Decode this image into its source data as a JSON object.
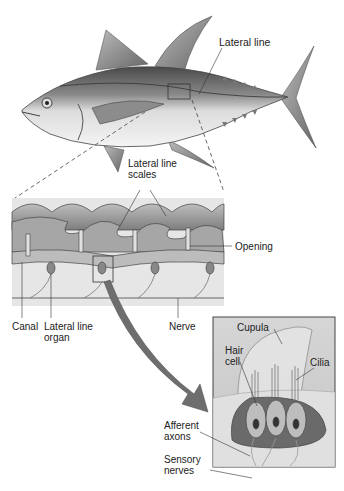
{
  "figure": {
    "panels": [
      "whole-fish",
      "lateral-line-scales-section",
      "neuromast-detail"
    ]
  },
  "labels": {
    "lateral_line_top": "Lateral line",
    "lateral_line_scales": "Lateral line\nscales",
    "opening": "Opening",
    "canal": "Canal",
    "lateral_line_organ": "Lateral line\norgan",
    "nerve": "Nerve",
    "cupula": "Cupula",
    "hair_cell": "Hair\ncell",
    "cilia": "Cilia",
    "afferent_axons": "Afferent\naxons",
    "sensory_nerves": "Sensory\nnerves"
  },
  "colors": {
    "line": "#333333",
    "fish_dark": "#5a5a5a",
    "fish_light": "#e6e6e6",
    "scale": "#9a9a9a",
    "tissue": "#d8d8d8",
    "arrow": "#6e6e6e",
    "inset_bg": "#d0d0d0",
    "cell": "#7a7a7a"
  }
}
